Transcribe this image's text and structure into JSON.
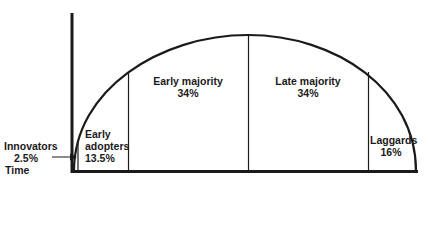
{
  "diagram": {
    "type": "adoption-curve",
    "axis": {
      "x_label": "Time"
    },
    "segments": [
      {
        "name": "Innovators",
        "percent": "2.5%"
      },
      {
        "name": "Early adopters",
        "line1": "Early",
        "line2": "adopters",
        "percent": "13.5%"
      },
      {
        "name": "Early majority",
        "percent": "34%"
      },
      {
        "name": "Late majority",
        "percent": "34%"
      },
      {
        "name": "Laggards",
        "percent": "16%"
      }
    ],
    "colors": {
      "stroke": "#1a1a1a",
      "background": "#ffffff"
    }
  }
}
